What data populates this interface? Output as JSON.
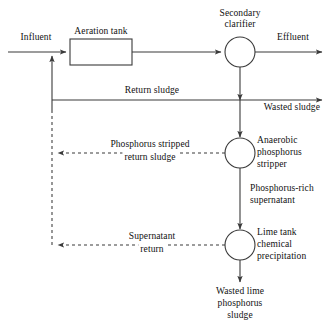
{
  "diagram": {
    "type": "process-flow",
    "canvas": {
      "width": 335,
      "height": 323
    },
    "colors": {
      "line": "#3a3a3a",
      "text": "#111111",
      "background": "#ffffff"
    },
    "nodes": [
      {
        "id": "aeration-tank",
        "label": "Aeration tank",
        "shape": "rectangle",
        "x": 70,
        "y": 39,
        "width": 62,
        "height": 26,
        "label_position": "above"
      },
      {
        "id": "secondary-clarifier",
        "label": "Secondary\nclarifier",
        "label_line1": "Secondary",
        "label_line2": "clarifier",
        "shape": "circle",
        "cx": 240,
        "cy": 52,
        "r": 15,
        "label_position": "above"
      },
      {
        "id": "anaerobic-phosphorus-stripper",
        "label": "Anaerobic\nphosphorus\nstripper",
        "label_line1": "Anaerobic",
        "label_line2": "phosphorus",
        "label_line3": "stripper",
        "shape": "circle",
        "cx": 240,
        "cy": 153,
        "r": 15,
        "label_position": "right"
      },
      {
        "id": "lime-tank",
        "label": "Lime tank\nchemical\nprecipitation",
        "label_line1": "Lime tank",
        "label_line2": "chemical",
        "label_line3": "precipitation",
        "shape": "circle",
        "cx": 240,
        "cy": 245,
        "r": 15,
        "label_position": "right"
      }
    ],
    "stream_labels": [
      {
        "id": "influent",
        "text": "Influent",
        "x": 36,
        "y": 38,
        "align": "center",
        "style": "solid"
      },
      {
        "id": "effluent",
        "text": "Effluent",
        "x": 293,
        "y": 38,
        "align": "center",
        "style": "solid"
      },
      {
        "id": "return-sludge",
        "text": "Return sludge",
        "x": 152,
        "y": 87,
        "align": "center",
        "style": "solid"
      },
      {
        "id": "wasted-sludge",
        "text": "Wasted sludge",
        "x": 300,
        "y": 104,
        "align": "right",
        "style": "solid"
      },
      {
        "id": "phosphorus-stripped-return-sludge-line1",
        "text": "Phosphorus stripped",
        "x": 150,
        "y": 141,
        "align": "center",
        "style": "dashed"
      },
      {
        "id": "phosphorus-stripped-return-sludge-line2",
        "text": "return sludge",
        "x": 150,
        "y": 152,
        "align": "center",
        "style": "dashed"
      },
      {
        "id": "phosphorus-rich-supernatant-line1",
        "text": "Phosphorus-rich",
        "x": 250,
        "y": 185,
        "align": "left",
        "style": "solid"
      },
      {
        "id": "phosphorus-rich-supernatant-line2",
        "text": "supernatant",
        "x": 250,
        "y": 196,
        "align": "left",
        "style": "solid"
      },
      {
        "id": "supernatant-return-line1",
        "text": "Supernatant",
        "x": 152,
        "y": 233,
        "align": "center",
        "style": "dashed"
      },
      {
        "id": "supernatant-return-line2",
        "text": "return",
        "x": 152,
        "y": 244,
        "align": "center",
        "style": "dashed"
      },
      {
        "id": "wasted-lime-phosphorus-sludge-line1",
        "text": "Wasted lime",
        "x": 240,
        "y": 288,
        "align": "center",
        "style": "solid"
      },
      {
        "id": "wasted-lime-phosphorus-sludge-line2",
        "text": "phosphorus",
        "x": 240,
        "y": 299,
        "align": "center",
        "style": "solid"
      },
      {
        "id": "wasted-lime-phosphorus-sludge-line3",
        "text": "sludge",
        "x": 240,
        "y": 310,
        "align": "center",
        "style": "solid"
      }
    ],
    "node_labels": {
      "aeration_tank": "Aeration tank",
      "secondary_clarifier_l1": "Secondary",
      "secondary_clarifier_l2": "clarifier",
      "stripper_l1": "Anaerobic",
      "stripper_l2": "phosphorus",
      "stripper_l3": "stripper",
      "lime_l1": "Lime tank",
      "lime_l2": "chemical",
      "lime_l3": "precipitation"
    },
    "connections": [
      {
        "id": "influent-to-junction",
        "from": "influent-source",
        "to": "aeration-tank",
        "style": "solid",
        "arrow": true
      },
      {
        "id": "aeration-to-clarifier",
        "from": "aeration-tank",
        "to": "secondary-clarifier",
        "style": "solid",
        "arrow": true
      },
      {
        "id": "clarifier-to-effluent",
        "from": "secondary-clarifier",
        "to": "effluent-sink",
        "style": "solid",
        "arrow": true
      },
      {
        "id": "clarifier-to-return-sludge",
        "from": "secondary-clarifier",
        "to": "return-sludge-line",
        "style": "solid",
        "arrow": true
      },
      {
        "id": "return-sludge-to-aeration",
        "from": "return-sludge-line",
        "to": "aeration-tank",
        "style": "solid",
        "arrow": true
      },
      {
        "id": "return-sludge-to-wasted",
        "from": "return-sludge-line",
        "to": "wasted-sludge-sink",
        "style": "solid",
        "arrow": true
      },
      {
        "id": "wasted-to-stripper",
        "from": "return-sludge-line",
        "to": "anaerobic-phosphorus-stripper",
        "style": "solid",
        "arrow": true
      },
      {
        "id": "stripper-return-dashed",
        "from": "anaerobic-phosphorus-stripper",
        "to": "recycle-riser",
        "style": "dashed",
        "arrow": true
      },
      {
        "id": "stripper-to-lime",
        "from": "anaerobic-phosphorus-stripper",
        "to": "lime-tank",
        "style": "solid",
        "arrow": true
      },
      {
        "id": "lime-supernatant-dashed",
        "from": "lime-tank",
        "to": "recycle-riser",
        "style": "dashed",
        "arrow": true
      },
      {
        "id": "lime-to-waste",
        "from": "lime-tank",
        "to": "wasted-lime-sink",
        "style": "solid",
        "arrow": true
      },
      {
        "id": "recycle-riser",
        "from": "recycle-riser-bottom",
        "to": "return-sludge-line",
        "style": "dashed",
        "arrow": true
      }
    ]
  }
}
